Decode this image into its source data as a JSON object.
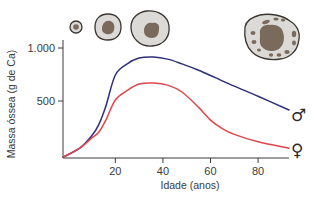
{
  "chart_data": {
    "type": "line",
    "title": "",
    "xlabel": "Idade (anos)",
    "ylabel": "Massa óssea (g de Ca)",
    "xlim": [
      -2,
      93
    ],
    "ylim": [
      -40,
      1000
    ],
    "x_ticks": [
      20,
      40,
      60,
      80
    ],
    "x_tick_labels": [
      "20",
      "40",
      "60",
      "80"
    ],
    "y_ticks": [
      500,
      1000
    ],
    "y_tick_labels": [
      "500",
      "1.000"
    ],
    "grid": false,
    "legend": "right-end-symbols",
    "series": [
      {
        "name": "Masculino",
        "symbol": "♂",
        "color": "#2e2f7a",
        "x": [
          -2,
          5,
          10,
          13,
          16,
          20,
          25,
          30,
          36,
          42,
          48,
          55,
          62,
          70,
          80,
          93
        ],
        "y": [
          -30,
          55,
          170,
          275,
          450,
          745,
          850,
          905,
          915,
          895,
          850,
          790,
          720,
          640,
          545,
          415
        ]
      },
      {
        "name": "Feminino",
        "symbol": "♀",
        "color": "#e0474c",
        "x": [
          -2,
          5,
          10,
          13,
          16,
          20,
          25,
          30,
          36,
          42,
          48,
          55,
          60,
          65,
          70,
          80,
          93
        ],
        "y": [
          -30,
          55,
          150,
          205,
          320,
          510,
          600,
          660,
          670,
          650,
          585,
          440,
          320,
          240,
          185,
          115,
          55
        ]
      }
    ],
    "illustrations": [
      {
        "name": "bone-cross-section-tiny",
        "age_stage": "infância"
      },
      {
        "name": "bone-cross-section-small",
        "age_stage": "jovem"
      },
      {
        "name": "bone-cross-section-peak",
        "age_stage": "adulto"
      },
      {
        "name": "bone-cross-section-porous",
        "age_stage": "idoso"
      }
    ]
  },
  "colors": {
    "axis": "#3a3a3a",
    "bone_fill": "#dcdad6",
    "marrow_fill": "#7a6a5c",
    "bone_outline": "#3a3530"
  }
}
